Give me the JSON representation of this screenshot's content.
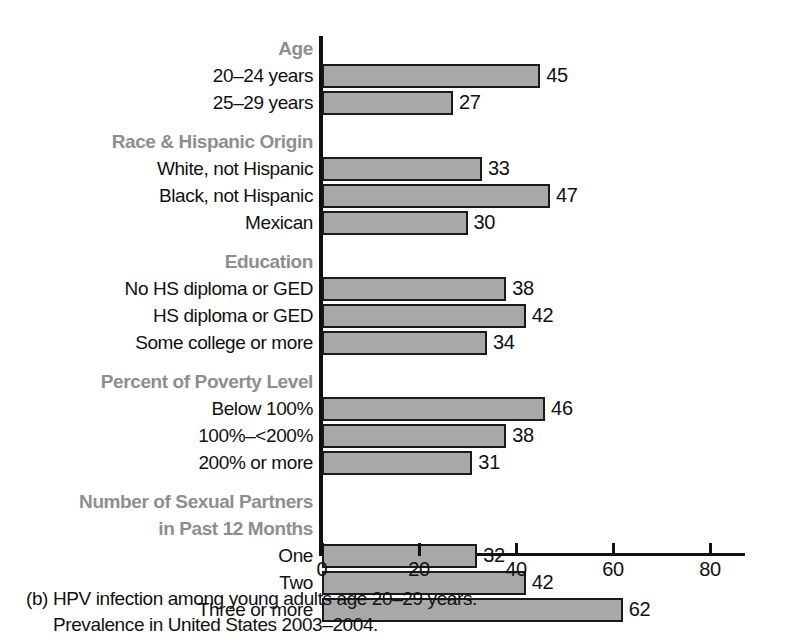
{
  "chart_data": {
    "type": "bar",
    "orientation": "horizontal",
    "title": "",
    "xlabel": "",
    "ylabel": "",
    "xlim": [
      0,
      87
    ],
    "xticks": [
      0,
      20,
      40,
      60,
      80
    ],
    "xtick_labels": [
      "0",
      "20",
      "40",
      "60",
      "80"
    ],
    "grid": false,
    "legend": null,
    "bar_color": "#a8a8a8",
    "bar_edge_color": "#1a1a1a",
    "group_label_color": "#8e8e8e",
    "groups": [
      {
        "header": "Age",
        "rows": [
          {
            "label": "20–24 years",
            "value": 45
          },
          {
            "label": "25–29 years",
            "value": 27
          }
        ]
      },
      {
        "header": "Race & Hispanic Origin",
        "rows": [
          {
            "label": "White, not Hispanic",
            "value": 33
          },
          {
            "label": "Black, not Hispanic",
            "value": 47
          },
          {
            "label": "Mexican",
            "value": 30
          }
        ]
      },
      {
        "header": "Education",
        "rows": [
          {
            "label": "No HS diploma or GED",
            "value": 38
          },
          {
            "label": "HS diploma or GED",
            "value": 42
          },
          {
            "label": "Some college or more",
            "value": 34
          }
        ]
      },
      {
        "header": "Percent of Poverty Level",
        "rows": [
          {
            "label": "Below 100%",
            "value": 46
          },
          {
            "label": "100%–<200%",
            "value": 38
          },
          {
            "label": "200% or more",
            "value": 31
          }
        ]
      },
      {
        "header": "Number of Sexual Partners",
        "header2": "in Past 12 Months",
        "rows": [
          {
            "label": "One",
            "value": 32
          },
          {
            "label": "Two",
            "value": 42
          },
          {
            "label": "Three or more",
            "value": 62
          }
        ]
      }
    ],
    "categories": [
      "20–24 years",
      "25–29 years",
      "White, not Hispanic",
      "Black, not Hispanic",
      "Mexican",
      "No HS diploma or GED",
      "HS diploma or GED",
      "Some college or more",
      "Below 100%",
      "100%–<200%",
      "200% or more",
      "One",
      "Two",
      "Three or more"
    ],
    "values": [
      45,
      27,
      33,
      47,
      30,
      38,
      42,
      34,
      46,
      38,
      31,
      32,
      42,
      62
    ]
  },
  "caption": {
    "line1": "(b) HPV infection among young adults age 20–29 years.",
    "line2": "Prevalence in United States 2003–2004."
  }
}
